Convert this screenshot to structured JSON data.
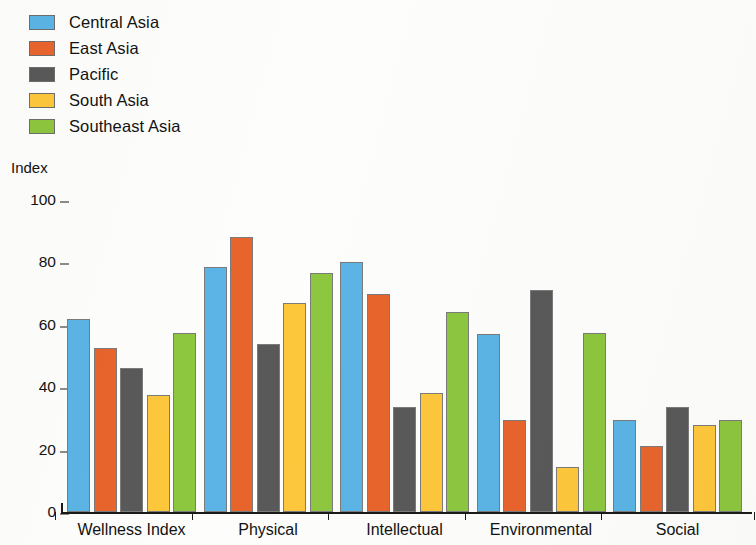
{
  "chart_data": {
    "type": "bar",
    "title": "",
    "subtitle": "",
    "xlabel": "",
    "ylabel": "Index",
    "ylim": [
      0,
      100
    ],
    "yticks": [
      0,
      20,
      40,
      60,
      80,
      100
    ],
    "ytick_labels": [
      "0",
      "20",
      "40",
      "60",
      "80",
      "100"
    ],
    "grid": false,
    "legend_position": "top-left",
    "categories": [
      "Wellness Index",
      "Physical",
      "Intellectual",
      "Environmental",
      "Social"
    ],
    "series": [
      {
        "name": "Central Asia",
        "color": "#5BB4E5",
        "values": [
          62,
          78.5,
          80,
          57,
          29.5
        ]
      },
      {
        "name": "East Asia",
        "color": "#E8642D",
        "values": [
          52.5,
          88,
          70,
          29.5,
          21
        ]
      },
      {
        "name": "Pacific",
        "color": "#595959",
        "values": [
          46,
          54,
          33.5,
          71,
          33.5
        ]
      },
      {
        "name": "South Asia",
        "color": "#FDC73C",
        "values": [
          37.5,
          67,
          38,
          14.5,
          28
        ]
      },
      {
        "name": "Southeast Asia",
        "color": "#8DC63F",
        "values": [
          57.5,
          76.5,
          64,
          57.5,
          29.5
        ]
      }
    ]
  },
  "legend": {
    "items": [
      {
        "label": "Central Asia"
      },
      {
        "label": "East Asia"
      },
      {
        "label": "Pacific"
      },
      {
        "label": "South Asia"
      },
      {
        "label": "Southeast Asia"
      }
    ]
  },
  "axis": {
    "y_title": "Index"
  },
  "colors": {
    "central_asia": "#5BB4E5",
    "east_asia": "#E8642D",
    "pacific": "#595959",
    "south_asia": "#FDC73C",
    "southeast_asia": "#8DC63F",
    "axis": "#1a1a1a",
    "text": "#121212",
    "background": "#fdfdfb"
  }
}
